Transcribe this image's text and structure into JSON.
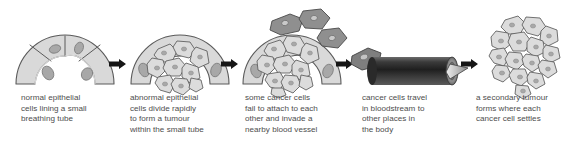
{
  "figure": {
    "type": "biology-process-diagram",
    "background_color": "#ffffff",
    "cell_fill_color": "#d9d9d9",
    "cell_stroke_color": "#595959",
    "nucleus_color": "#a6a6a6",
    "dark_cell_fill_color": "#8c8c8c",
    "vessel_color": "#3d3d3d",
    "arrow_color": "#1a1a1a",
    "text_color": "#4d4d4d"
  },
  "stages": [
    {
      "index": 1,
      "illustration_name": "normal-epithelium-dome",
      "caption": "normal epithelial\ncells lining a small\nbreathing tube"
    },
    {
      "index": 2,
      "illustration_name": "abnormal-cells-tumour-dome",
      "caption": "abnormal epithelial\ncells divide rapidly\nto form a tumour\nwithin the small tube"
    },
    {
      "index": 3,
      "illustration_name": "cells-detaching-invading",
      "caption": "some cancer cells\nfail to attach to each\nother and invade a\nnearby blood vessel"
    },
    {
      "index": 4,
      "illustration_name": "blood-vessel-transport",
      "caption": "cancer cells travel\nin bloodstream to\nother places in\nthe body"
    },
    {
      "index": 5,
      "illustration_name": "secondary-tumour-cluster",
      "caption": "a secondary tumour\nforms where each\ncancer cell settles"
    }
  ],
  "arrows": [
    {
      "name": "arrow-stage-1-to-2"
    },
    {
      "name": "arrow-stage-2-to-3"
    },
    {
      "name": "arrow-stage-3-to-4"
    },
    {
      "name": "arrow-stage-4-to-5"
    }
  ]
}
